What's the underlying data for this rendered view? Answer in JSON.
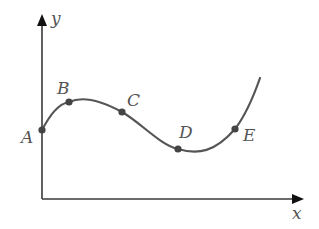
{
  "diagram": {
    "axes": {
      "x_label": "x",
      "y_label": "y",
      "color": "#3a3a3a"
    },
    "curve": {
      "color": "#555555",
      "description": "smooth curve rising from A to a maximum near B, descending through C to a minimum near D, then rising steeply through E"
    },
    "points": [
      {
        "label": "A",
        "x": 42,
        "y": 130
      },
      {
        "label": "B",
        "x": 69,
        "y": 102
      },
      {
        "label": "C",
        "x": 122,
        "y": 112
      },
      {
        "label": "D",
        "x": 178,
        "y": 149
      },
      {
        "label": "E",
        "x": 235,
        "y": 129
      }
    ]
  }
}
